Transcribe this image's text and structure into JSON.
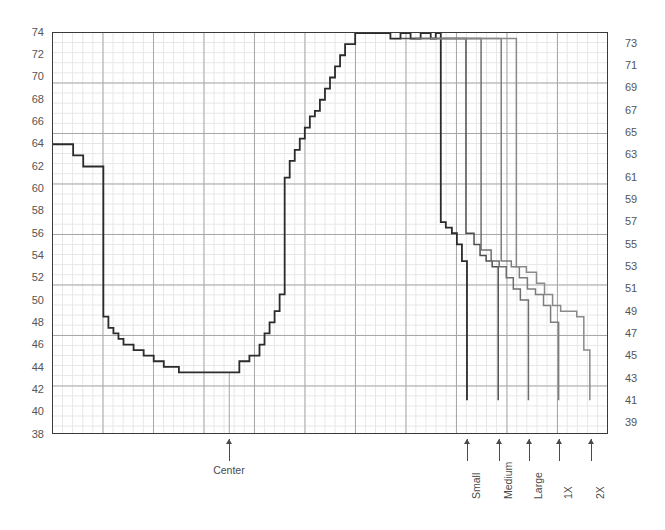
{
  "chart_data": {
    "type": "line",
    "title": "",
    "subtitle": "",
    "xlabel": "",
    "ylabel": "",
    "grid": true,
    "legend_position": "none",
    "ylim": [
      38,
      74
    ],
    "xlim": [
      0,
      55
    ],
    "y_ticks_left": [
      38,
      40,
      42,
      44,
      46,
      48,
      50,
      52,
      54,
      56,
      58,
      60,
      62,
      64,
      66,
      68,
      70,
      72,
      74
    ],
    "y_ticks_right": [
      39,
      41,
      43,
      45,
      47,
      49,
      51,
      53,
      55,
      57,
      59,
      61,
      63,
      65,
      67,
      69,
      71,
      73
    ],
    "annotations": [
      {
        "label": "Center",
        "x": 17.5,
        "orientation": "horizontal"
      },
      {
        "label": "Small",
        "x": 41.1,
        "orientation": "vertical"
      },
      {
        "label": "Medium",
        "x": 44.2,
        "orientation": "vertical"
      },
      {
        "label": "Large",
        "x": 47.2,
        "orientation": "vertical"
      },
      {
        "label": "1X",
        "x": 50.2,
        "orientation": "vertical"
      },
      {
        "label": "2X",
        "x": 53.3,
        "orientation": "vertical"
      }
    ],
    "series": [
      {
        "name": "Small",
        "color": "#2b2b2b",
        "width": 1.8,
        "step": "post",
        "x": [
          0.0,
          2.0,
          3.0,
          4.0,
          5.0,
          5.5,
          6.0,
          6.5,
          7.0,
          8.0,
          9.0,
          10.0,
          11.0,
          12.5,
          14.0,
          16.0,
          18.5,
          19.5,
          20.5,
          21.0,
          21.5,
          22.0,
          22.5,
          23.0,
          23.5,
          24.0,
          24.5,
          25.0,
          25.5,
          26.0,
          26.5,
          27.0,
          27.5,
          28.0,
          28.5,
          29.0,
          30.0,
          31.0,
          32.0,
          33.5,
          34.5,
          35.5,
          36.5,
          37.5,
          38.0,
          38.5,
          39.0,
          39.6,
          40.1,
          40.6,
          41.1,
          41.1
        ],
        "y": [
          64.0,
          63.0,
          62.0,
          62.0,
          48.5,
          47.5,
          47.0,
          46.5,
          46.0,
          45.5,
          45.0,
          44.5,
          44.0,
          43.5,
          43.5,
          43.5,
          44.5,
          45.0,
          46.0,
          47.0,
          48.0,
          49.0,
          50.5,
          61.0,
          62.5,
          63.5,
          64.5,
          65.5,
          66.5,
          67.0,
          68.0,
          69.0,
          70.0,
          71.0,
          72.0,
          73.0,
          74.0,
          74.0,
          74.0,
          73.5,
          74.0,
          73.5,
          74.0,
          73.5,
          74.0,
          57.0,
          56.5,
          56.0,
          55.0,
          53.5,
          52.5,
          41.0
        ]
      },
      {
        "name": "Medium",
        "color": "#4f4f4f",
        "width": 1.5,
        "step": "post",
        "x": [
          34.5,
          36.0,
          37.5,
          39.0,
          40.0,
          41.0,
          41.8,
          42.4,
          43.0,
          43.6,
          44.2,
          44.2
        ],
        "y": [
          73.5,
          73.5,
          73.5,
          73.5,
          73.5,
          56.0,
          55.0,
          54.0,
          53.5,
          53.0,
          52.5,
          41.0
        ]
      },
      {
        "name": "Large",
        "color": "#6f6f6f",
        "width": 1.5,
        "step": "post",
        "x": [
          36.0,
          38.0,
          40.0,
          41.5,
          42.5,
          43.5,
          44.3,
          45.0,
          45.7,
          46.4,
          47.2,
          47.2
        ],
        "y": [
          73.5,
          73.5,
          73.5,
          73.5,
          54.5,
          53.5,
          53.0,
          52.0,
          51.0,
          50.0,
          49.0,
          41.0
        ]
      },
      {
        "name": "1X",
        "color": "#7d7d7d",
        "width": 1.5,
        "step": "post",
        "x": [
          37.5,
          39.5,
          41.5,
          43.5,
          44.5,
          45.5,
          46.3,
          47.1,
          47.9,
          48.7,
          49.4,
          50.2,
          50.2
        ],
        "y": [
          73.5,
          73.5,
          73.5,
          73.5,
          53.5,
          53.0,
          52.0,
          51.0,
          50.5,
          49.5,
          48.0,
          45.5,
          41.0
        ]
      },
      {
        "name": "2X",
        "color": "#8a8a8a",
        "width": 1.5,
        "step": "post",
        "x": [
          39.0,
          42.0,
          44.5,
          46.0,
          47.0,
          48.0,
          48.8,
          49.6,
          50.4,
          51.2,
          52.0,
          52.7,
          53.3,
          53.3
        ],
        "y": [
          73.5,
          73.5,
          73.5,
          53.0,
          52.5,
          51.5,
          50.5,
          49.5,
          49.0,
          49.0,
          48.5,
          45.5,
          44.5,
          41.0
        ]
      }
    ]
  },
  "axes": {
    "left_label": "",
    "right_label": ""
  }
}
